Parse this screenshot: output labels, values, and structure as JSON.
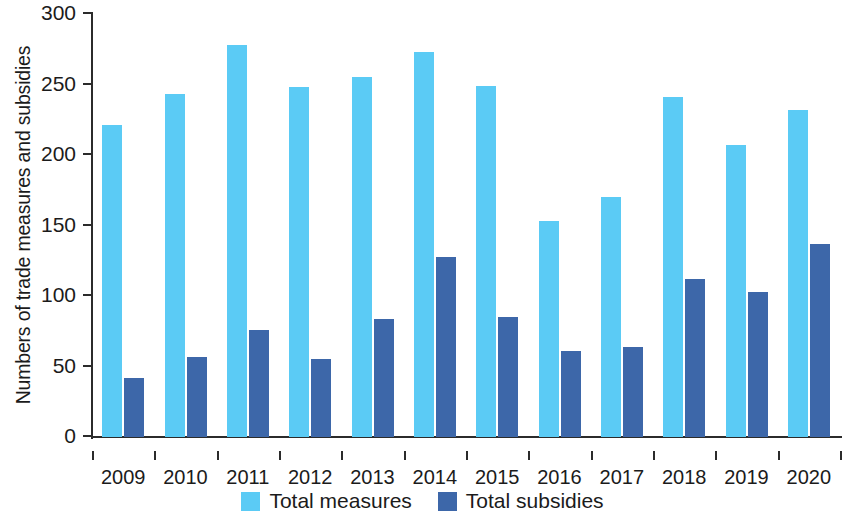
{
  "chart_data": {
    "type": "bar",
    "title": "",
    "xlabel": "",
    "ylabel": "Numbers of trade measures and subsidies",
    "categories": [
      "2009",
      "2010",
      "2011",
      "2012",
      "2013",
      "2014",
      "2015",
      "2016",
      "2017",
      "2018",
      "2019",
      "2020"
    ],
    "series": [
      {
        "name": "Total measures",
        "color": "#5bcbf5",
        "values": [
          221,
          243,
          278,
          248,
          255,
          273,
          249,
          153,
          170,
          241,
          207,
          232
        ]
      },
      {
        "name": "Total subsidies",
        "color": "#3d67a9",
        "values": [
          42,
          57,
          76,
          55,
          84,
          128,
          85,
          61,
          64,
          112,
          103,
          137
        ]
      }
    ],
    "ylim": [
      0,
      300
    ],
    "yticks": [
      0,
      50,
      100,
      150,
      200,
      250,
      300
    ],
    "ytick_labels": [
      "0",
      "50",
      "100",
      "150",
      "200",
      "250",
      "300"
    ],
    "grid": false,
    "legend_position": "bottom"
  }
}
